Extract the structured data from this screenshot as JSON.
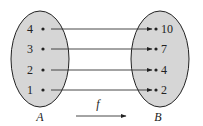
{
  "diagram": {
    "function_label": "f",
    "domain": {
      "name": "A",
      "elements": [
        "4",
        "3",
        "2",
        "1"
      ]
    },
    "codomain": {
      "name": "B",
      "elements": [
        "10",
        "7",
        "4",
        "2"
      ]
    },
    "mappings": [
      {
        "from": "4",
        "to": "10"
      },
      {
        "from": "3",
        "to": "7"
      },
      {
        "from": "2",
        "to": "4"
      },
      {
        "from": "1",
        "to": "2"
      }
    ],
    "colors": {
      "set_fill": "#d6d6d6",
      "stroke": "#222222"
    }
  }
}
